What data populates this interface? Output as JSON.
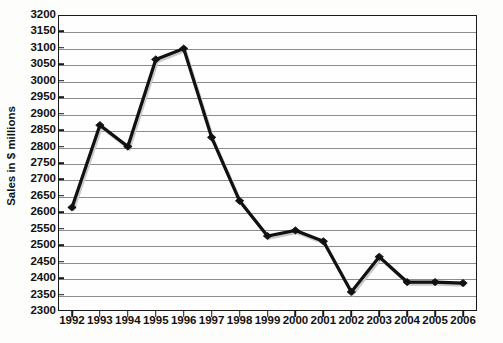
{
  "chart_data": {
    "type": "line",
    "title": "",
    "xlabel": "",
    "ylabel": "Sales in $ millions",
    "categories": [
      "1992",
      "1993",
      "1994",
      "1995",
      "1996",
      "1997",
      "1998",
      "1999",
      "2000",
      "2001",
      "2002",
      "2003",
      "2004",
      "2005",
      "2006"
    ],
    "values": [
      2615,
      2865,
      2800,
      3065,
      3098,
      2828,
      2635,
      2528,
      2545,
      2512,
      2358,
      2465,
      2388,
      2388,
      2385
    ],
    "series": [
      {
        "name": "Sales",
        "values": [
          2615,
          2865,
          2800,
          3065,
          3098,
          2828,
          2635,
          2528,
          2545,
          2512,
          2358,
          2465,
          2388,
          2388,
          2385
        ]
      }
    ],
    "ylim": [
      2300,
      3200
    ],
    "ytick_step": 50,
    "yticks": [
      2300,
      2350,
      2400,
      2450,
      2500,
      2550,
      2600,
      2650,
      2700,
      2750,
      2800,
      2850,
      2900,
      2950,
      3000,
      3050,
      3100,
      3150,
      3200
    ],
    "ytick_labels": [
      "2300",
      "2350",
      "2400",
      "2450",
      "2500",
      "2550",
      "2600",
      "2650",
      "2700",
      "2750",
      "2800",
      "2850",
      "2900",
      "2950",
      "3000",
      "3050",
      "3100",
      "3150",
      "3200"
    ],
    "xtick_labels": [
      "1992",
      "1993",
      "1994",
      "1995",
      "1996",
      "1997",
      "1998",
      "1999",
      "2000",
      "2001",
      "2002",
      "2003",
      "2004",
      "2005",
      "2006"
    ],
    "grid": true,
    "grid_axis": "y",
    "legend": false,
    "legend_position": "none",
    "marker": "diamond",
    "colors": {
      "line": "#111111",
      "marker": "#111111",
      "grid": "#8c8c8c",
      "axis": "#1a1a1a",
      "background": "#fefefe",
      "text": "#111111"
    }
  },
  "axes": {
    "y_title": "Sales in $ millions"
  }
}
